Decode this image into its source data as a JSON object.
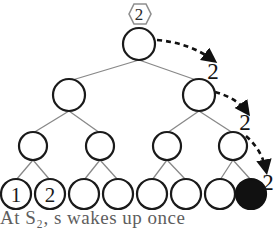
{
  "figure": {
    "type": "binary-tree-diagram",
    "title_marker": {
      "shape": "hexagon",
      "label": "2"
    },
    "tree": {
      "levels": 4,
      "level_1": [
        {
          "id": "root",
          "label": "",
          "filled": false,
          "cx": 139,
          "cy": 44,
          "r": 16
        }
      ],
      "level_2": [
        {
          "id": "n2-0",
          "label": "",
          "filled": false,
          "cx": 69,
          "cy": 95,
          "r": 16
        },
        {
          "id": "n2-1",
          "label": "",
          "filled": false,
          "cx": 199,
          "cy": 95,
          "r": 16
        }
      ],
      "level_3": [
        {
          "id": "n3-0",
          "label": "",
          "filled": false,
          "cx": 33,
          "cy": 146,
          "r": 14
        },
        {
          "id": "n3-1",
          "label": "",
          "filled": false,
          "cx": 100,
          "cy": 146,
          "r": 14
        },
        {
          "id": "n3-2",
          "label": "",
          "filled": false,
          "cx": 167,
          "cy": 146,
          "r": 14
        },
        {
          "id": "n3-3",
          "label": "",
          "filled": false,
          "cx": 233,
          "cy": 146,
          "r": 14
        }
      ],
      "level_4": [
        {
          "id": "leaf-0",
          "label": "1",
          "filled": false,
          "cx": 16,
          "cy": 194,
          "r": 15
        },
        {
          "id": "leaf-1",
          "label": "2",
          "filled": false,
          "cx": 50,
          "cy": 194,
          "r": 15
        },
        {
          "id": "leaf-2",
          "label": "",
          "filled": false,
          "cx": 84,
          "cy": 194,
          "r": 15
        },
        {
          "id": "leaf-3",
          "label": "",
          "filled": false,
          "cx": 118,
          "cy": 194,
          "r": 15
        },
        {
          "id": "leaf-4",
          "label": "",
          "filled": false,
          "cx": 152,
          "cy": 194,
          "r": 15
        },
        {
          "id": "leaf-5",
          "label": "",
          "filled": false,
          "cx": 186,
          "cy": 194,
          "r": 15
        },
        {
          "id": "leaf-6",
          "label": "",
          "filled": false,
          "cx": 220,
          "cy": 194,
          "r": 15
        },
        {
          "id": "leaf-7",
          "label": "",
          "filled": true,
          "cx": 251,
          "cy": 194,
          "r": 15
        }
      ]
    },
    "dashed_arrows": [
      {
        "id": "arrow-1",
        "label": "2",
        "label_x": 213,
        "label_y": 79
      },
      {
        "id": "arrow-2",
        "label": "2",
        "label_x": 245,
        "label_y": 130
      },
      {
        "id": "arrow-3",
        "label": "2",
        "label_x": 268,
        "label_y": 190
      }
    ],
    "caption": "At  S₂,  s  wakes  up  once",
    "colors": {
      "node_stroke": "#1a1a1a",
      "node_fill": "#ffffff",
      "filled_node": "#111111",
      "edge": "#808080",
      "dashed_arrow": "#111111",
      "hexagon_stroke": "#8a8a8a",
      "text": "#1a1a1a",
      "background": "#ffffff"
    }
  }
}
